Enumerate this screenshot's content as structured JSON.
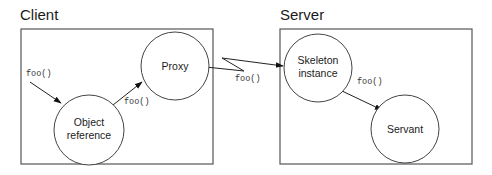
{
  "diagram": {
    "regions": [
      {
        "id": "client",
        "title": "Client",
        "x": 21,
        "y": 29,
        "w": 192,
        "h": 135,
        "title_x": 20,
        "title_y": 20
      },
      {
        "id": "server",
        "title": "Server",
        "x": 280,
        "y": 29,
        "w": 192,
        "h": 135,
        "title_x": 280,
        "title_y": 20
      }
    ],
    "nodes": [
      {
        "id": "proxy",
        "lines": [
          "Proxy"
        ],
        "cx": 175,
        "cy": 66,
        "r": 34
      },
      {
        "id": "object-reference",
        "lines": [
          "Object",
          "reference"
        ],
        "cx": 89,
        "cy": 130,
        "r": 35
      },
      {
        "id": "skeleton-instance",
        "lines": [
          "Skeleton",
          "instance"
        ],
        "cx": 318,
        "cy": 68,
        "r": 34
      },
      {
        "id": "servant",
        "lines": [
          "Servant"
        ],
        "cx": 405,
        "cy": 129,
        "r": 34
      }
    ],
    "edges": [
      {
        "from": "external",
        "to": "object-reference",
        "label": "foo()",
        "label_x": 26,
        "label_y": 76
      },
      {
        "from": "object-reference",
        "to": "proxy",
        "label": "foo()",
        "label_x": 124,
        "label_y": 104
      },
      {
        "from": "proxy",
        "to": "skeleton-instance",
        "label": "foo()",
        "label_x": 235,
        "label_y": 81,
        "style": "network-zigzag"
      },
      {
        "from": "skeleton-instance",
        "to": "servant",
        "label": "foo()",
        "label_x": 357,
        "label_y": 84
      }
    ],
    "colors": {
      "stroke": "#444444",
      "text": "#1a1a1a",
      "background": "#ffffff"
    }
  }
}
